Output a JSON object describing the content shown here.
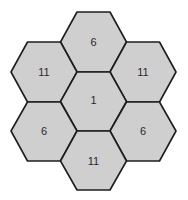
{
  "diagram": {
    "type": "hexagonal-cluster",
    "colors": {
      "fill": "#cfcfcf",
      "stroke": "#1e1e1e",
      "text": "#2a2a2a",
      "background": "#ffffff"
    },
    "cells": [
      {
        "id": "top",
        "label": "6",
        "cx": 93.5,
        "cy": 42
      },
      {
        "id": "upper-left",
        "label": "11",
        "cx": 44,
        "cy": 72
      },
      {
        "id": "upper-right",
        "label": "11",
        "cx": 143,
        "cy": 72
      },
      {
        "id": "center",
        "label": "1",
        "cx": 93.5,
        "cy": 101
      },
      {
        "id": "lower-left",
        "label": "6",
        "cx": 44,
        "cy": 131
      },
      {
        "id": "lower-right",
        "label": "6",
        "cx": 143,
        "cy": 131
      },
      {
        "id": "bottom",
        "label": "11",
        "cx": 93.5,
        "cy": 160
      }
    ]
  }
}
